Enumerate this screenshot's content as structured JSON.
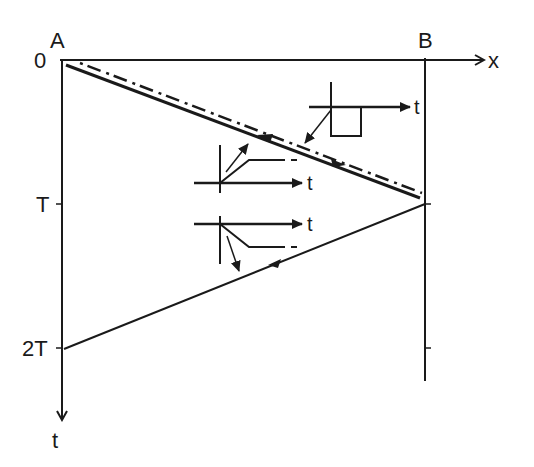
{
  "figure": {
    "title_cut_off": "",
    "labels": {
      "point_a": "A",
      "point_b": "B",
      "origin": "0",
      "x_axis": "x",
      "t_axis": "t",
      "tick_T": "T",
      "tick_2T": "2T"
    },
    "insets": [
      {
        "name": "square-pulse-inset",
        "axis_label": "t",
        "shape": "rectangular pulse below axis"
      },
      {
        "name": "rising-ramp-inset",
        "axis_label": "t",
        "shape": "ramp up then plateau (dashed continuation)"
      },
      {
        "name": "falling-ramp-inset",
        "axis_label": "t",
        "shape": "ramp down then plateau (dashed continuation)"
      }
    ],
    "lines": [
      {
        "name": "incident-wave-solid",
        "from": "A at t=0",
        "to": "B at t=T",
        "style": "solid, thick"
      },
      {
        "name": "incident-wave-dashed",
        "from": "A at t=0",
        "to": "B at t=T",
        "style": "dashed"
      },
      {
        "name": "reflected-wave",
        "from": "B at t=T",
        "to": "A at t=2T",
        "style": "solid"
      }
    ],
    "colors": {
      "ink": "#1a1a1a",
      "background": "#ffffff"
    }
  }
}
